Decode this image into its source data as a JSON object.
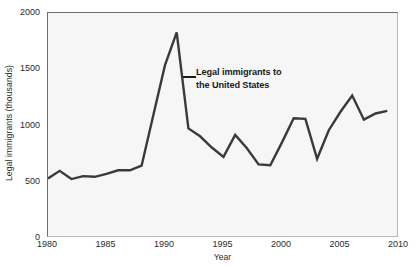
{
  "chart_data": {
    "type": "line",
    "title": "",
    "xlabel": "Year",
    "ylabel": "Legal immigrants (thousands)",
    "xlim": [
      1980,
      2010
    ],
    "ylim": [
      0,
      2000
    ],
    "grid": false,
    "legend": "none",
    "annotations": [
      {
        "text_line1": "Legal immigrants to",
        "text_line2": "the United States",
        "points_to_year": 1991
      }
    ],
    "xticks": [
      1980,
      1985,
      1990,
      1995,
      2000,
      2005,
      2010
    ],
    "xtick_labels": [
      "1980",
      "1985",
      "1990",
      "1995",
      "2000",
      "2005",
      "2010"
    ],
    "yticks": [
      0,
      500,
      1000,
      1500,
      2000
    ],
    "ytick_labels": [
      "0",
      "500",
      "1000",
      "1500",
      "2000"
    ],
    "series": [
      {
        "name": "Legal immigrants to the United States",
        "color": "#3a3a3a",
        "x": [
          1980,
          1981,
          1982,
          1983,
          1984,
          1985,
          1986,
          1987,
          1988,
          1989,
          1990,
          1991,
          1992,
          1993,
          1994,
          1995,
          1996,
          1997,
          1998,
          1999,
          2000,
          2001,
          2002,
          2003,
          2004,
          2005,
          2006,
          2007,
          2008,
          2009
        ],
        "values": [
          530,
          597,
          524,
          550,
          544,
          570,
          602,
          602,
          643,
          1091,
          1536,
          1827,
          974,
          904,
          804,
          721,
          916,
          798,
          654,
          647,
          850,
          1064,
          1059,
          704,
          958,
          1122,
          1266,
          1052,
          1107,
          1130
        ]
      }
    ]
  },
  "figure": {
    "background_color": "#ffffff",
    "plot_background_color": "#f6f6f6",
    "line_color": "#3a3a3a",
    "text_color": "#2b2b2b"
  }
}
